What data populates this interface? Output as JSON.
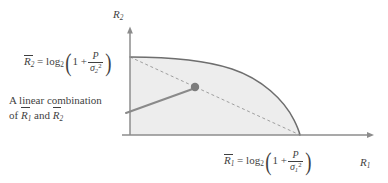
{
  "figure": {
    "name": "capacity-region-diagram",
    "background_color": "#ffffff"
  },
  "axes": {
    "x_label": "R",
    "x_label_sub": "1",
    "y_label": "R",
    "y_label_sub": "2",
    "axis_color": "#8c8c8c",
    "origin": [
      130,
      135
    ],
    "x_axis_end": [
      374,
      135
    ],
    "y_axis_top": [
      130,
      27
    ]
  },
  "region": {
    "name": "capacity-region",
    "fill_color": "#ededed",
    "border_color": "#6e6e6e",
    "y_intercept": [
      130,
      57
    ],
    "x_intercept": [
      300,
      135
    ]
  },
  "dashed_line": {
    "name": "time-sharing-line",
    "color": "#9a9a9a",
    "from": [
      130,
      57
    ],
    "to": [
      300,
      135
    ],
    "style": "dashed"
  },
  "pointer": {
    "name": "linear-combination-pointer",
    "color": "#8a8a8a",
    "from": [
      126,
      113
    ],
    "to": [
      195,
      88
    ]
  },
  "marker": {
    "name": "operating-point-dot",
    "color": "#7d7d7d",
    "center": [
      195,
      87
    ],
    "radius": 4.2
  },
  "labels": {
    "r2_formula": {
      "rbar": "R",
      "rbar_sub": "2",
      "equals": "=",
      "log": "log",
      "log_base": "2",
      "one_plus": "1 +",
      "numerator": "P",
      "denominator": "σ",
      "denominator_sub": "2",
      "denominator_sup": "2"
    },
    "r1_formula": {
      "rbar": "R",
      "rbar_sub": "1",
      "equals": "=",
      "log": "log",
      "log_base": "2",
      "one_plus": "1 +",
      "numerator": "P",
      "denominator": "σ",
      "denominator_sub": "1",
      "denominator_sup": "2"
    },
    "annotation": {
      "line1": "A linear combination",
      "line2_prefix": "of",
      "line2_r1": "R",
      "line2_r1_sub": "1",
      "line2_and": "and",
      "line2_r2": "R",
      "line2_r2_sub": "2"
    }
  }
}
